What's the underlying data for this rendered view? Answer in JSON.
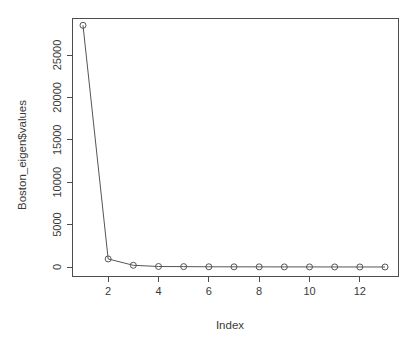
{
  "chart_data": {
    "type": "line",
    "title": "",
    "subtitle": "",
    "xlabel": "Index",
    "ylabel": "Boston_eigen$values",
    "x": [
      1,
      2,
      3,
      4,
      5,
      6,
      7,
      8,
      9,
      10,
      11,
      12,
      13
    ],
    "values": [
      28500,
      950,
      200,
      60,
      45,
      25,
      20,
      15,
      12,
      8,
      6,
      4,
      2
    ],
    "series": [
      {
        "name": "Boston_eigen$values",
        "values": [
          28500,
          950,
          200,
          60,
          45,
          25,
          20,
          15,
          12,
          8,
          6,
          4,
          2
        ]
      }
    ],
    "xlim": [
      0.5,
      13.5
    ],
    "ylim": [
      0,
      28500
    ],
    "xticks": [
      2,
      4,
      6,
      8,
      10,
      12
    ],
    "xtick_labels": [
      "2",
      "4",
      "6",
      "8",
      "10",
      "12"
    ],
    "yticks": [
      0,
      5000,
      10000,
      15000,
      20000,
      25000
    ],
    "ytick_labels": [
      "0",
      "5000",
      "10000",
      "15000",
      "20000",
      "25000"
    ],
    "grid": false,
    "legend": false,
    "legend_position": "none",
    "marker": "open-circle",
    "line_color": "#555555",
    "marker_color": "#555555",
    "axis_color": "#4d4d4d",
    "background_color": "#ffffff",
    "annotations": []
  }
}
